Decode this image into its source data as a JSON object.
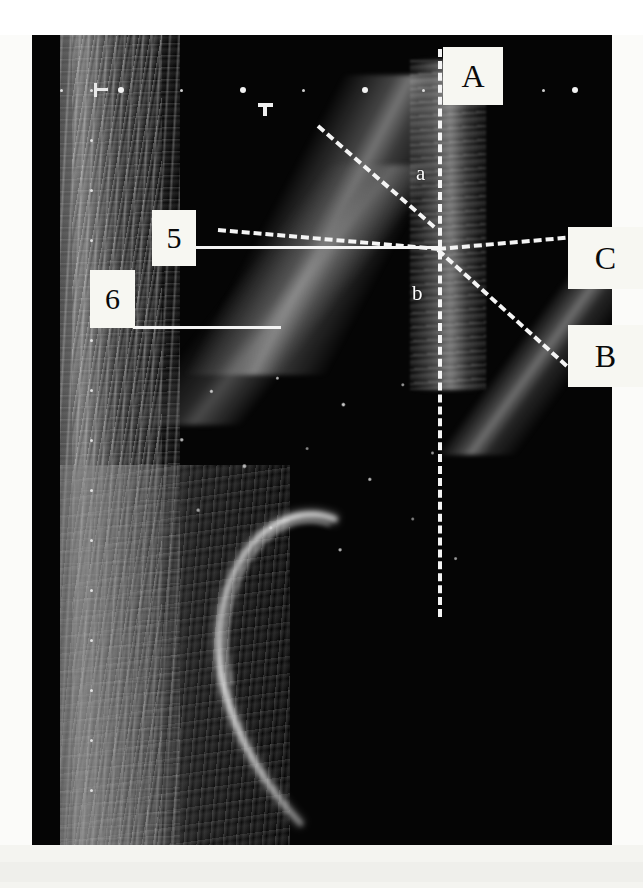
{
  "figure": {
    "kind": "annotated-ultrasound-image",
    "modality": "ultrasound B-mode",
    "background_color": "#fbfbf9",
    "scan_background_color": "#050505",
    "annotation_color": "#f4f4f4",
    "label_box_color": "#f7f7f2",
    "label_text_color": "#0a0a0a"
  },
  "labels": {
    "a": "A",
    "b": "B",
    "c": "C",
    "five": "5",
    "six": "6",
    "lower_a": "a",
    "lower_b": "b"
  },
  "annotations": [
    {
      "id": "A",
      "text": "A",
      "type": "callout-box",
      "points_to": "vertical-dashed-line"
    },
    {
      "id": "B",
      "text": "B",
      "type": "callout-box",
      "points_to": "descending-dashed-line"
    },
    {
      "id": "C",
      "text": "C",
      "type": "callout-box",
      "points_to": "horizontal-dashed-line"
    },
    {
      "id": "5",
      "text": "5",
      "type": "callout-box",
      "points_to": "upper-solid-line"
    },
    {
      "id": "6",
      "text": "6",
      "type": "callout-box",
      "points_to": "lower-solid-line"
    },
    {
      "id": "a",
      "text": "a",
      "type": "inline-letter",
      "region": "above-intersection"
    },
    {
      "id": "b",
      "text": "b",
      "type": "inline-letter",
      "region": "below-intersection"
    }
  ],
  "overlay_lines": [
    {
      "name": "vertical-dashed-line",
      "label": "A",
      "style": "dashed"
    },
    {
      "name": "diagonal-dashed-line",
      "label": "a",
      "style": "dashed"
    },
    {
      "name": "horizontal-dashed-line",
      "label": "C",
      "style": "dashed"
    },
    {
      "name": "descending-dashed-line",
      "label": "B",
      "style": "dashed"
    },
    {
      "name": "upper-solid-line",
      "label": "5",
      "style": "solid"
    },
    {
      "name": "lower-solid-line",
      "label": "6",
      "style": "solid"
    }
  ],
  "markers": {
    "orientation_marker": "orientation-marker",
    "caliper_marker": "caliper-marker",
    "depth_scale_left": "left-depth-scale",
    "depth_scale_top": "top-depth-scale"
  }
}
